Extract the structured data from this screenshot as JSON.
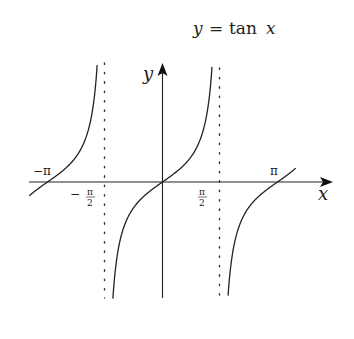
{
  "chart_data": {
    "type": "line",
    "title": "y = tan x",
    "title_parts": {
      "lhs": "y",
      "eq": "=",
      "fn": "tan",
      "arg": "x"
    },
    "xlabel": "x",
    "ylabel": "y",
    "function": "tan(x)",
    "xlim": [
      -3.65,
      4.5
    ],
    "ylim": [
      -4.6,
      4.8
    ],
    "grid": false,
    "legend": null,
    "asymptotes": [
      {
        "x": -1.5708,
        "label": "-π/2",
        "style": "dotted"
      },
      {
        "x": 1.5708,
        "label": "π/2",
        "style": "dotted"
      }
    ],
    "x_tick_labels": [
      {
        "x": -3.1416,
        "label": "-π",
        "numerator": "",
        "denominator": ""
      },
      {
        "x": -1.5708,
        "label": "-π/2",
        "numerator": "π",
        "denominator": "2"
      },
      {
        "x": 1.5708,
        "label": "π/2",
        "numerator": "π",
        "denominator": "2"
      },
      {
        "x": 3.1416,
        "label": "π",
        "numerator": "",
        "denominator": ""
      }
    ],
    "series": [
      {
        "name": "branch (-3π/2, -π/2)",
        "x_range": [
          -3.64,
          -1.75
        ],
        "sample": [
          [
            -3.64,
            -0.55
          ],
          [
            -3.1416,
            0
          ],
          [
            -2.5,
            0.75
          ],
          [
            -2.0,
            2.19
          ],
          [
            -1.75,
            5.57
          ]
        ]
      },
      {
        "name": "branch (-π/2, π/2)",
        "x_range": [
          -1.39,
          1.37
        ],
        "sample": [
          [
            -1.39,
            -5.4
          ],
          [
            -1.0,
            -1.56
          ],
          [
            -0.5,
            -0.55
          ],
          [
            0,
            0
          ],
          [
            0.5,
            0.55
          ],
          [
            1.0,
            1.56
          ],
          [
            1.37,
            4.9
          ]
        ]
      },
      {
        "name": "branch (π/2, 3π/2)",
        "x_range": [
          1.78,
          3.64
        ],
        "sample": [
          [
            1.78,
            -4.7
          ],
          [
            2.2,
            -1.37
          ],
          [
            2.6,
            -0.6
          ],
          [
            3.1416,
            0
          ],
          [
            3.64,
            0.55
          ]
        ]
      }
    ]
  },
  "labels": {
    "y_axis": "y",
    "x_axis": "x",
    "neg_pi": "−π",
    "pi": "π",
    "neg_sign": "−",
    "pi_sym": "π",
    "two": "2",
    "title_lhs": "y",
    "title_eq": "=",
    "title_fn": "tan",
    "title_arg": "x"
  }
}
